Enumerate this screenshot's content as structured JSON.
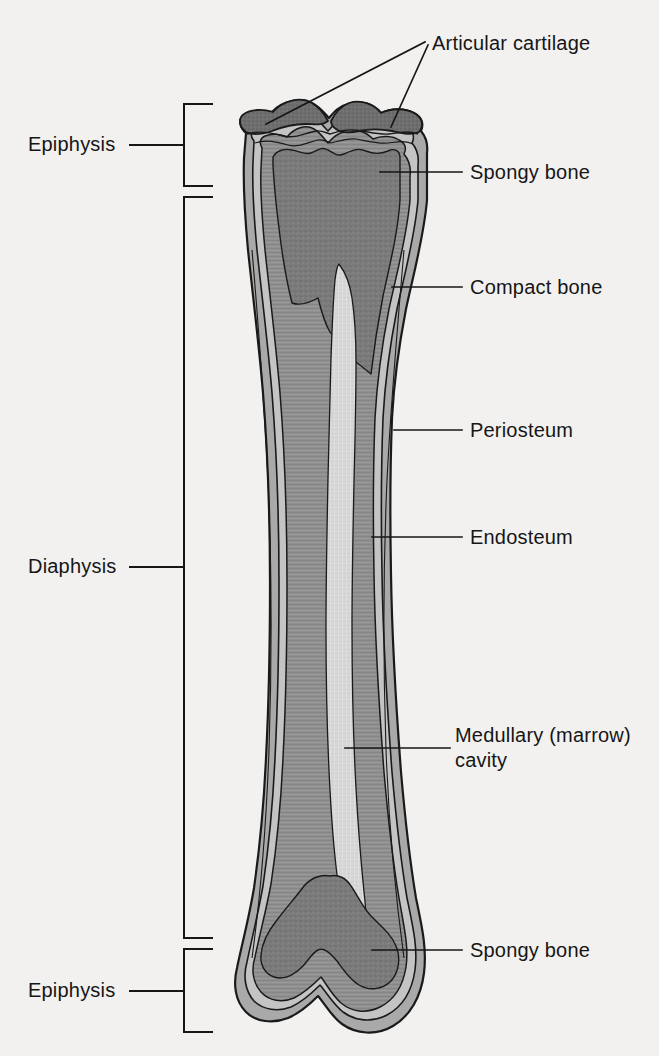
{
  "figure": {
    "background_color": "#f2f1ef",
    "ink_color": "#161616",
    "faint_top_text": "",
    "regions": {
      "spongy_bone_color": "#7b7b7b",
      "compact_bone_color": "#8f8f8f",
      "periosteum_color": "#a9a9a9",
      "endosteum_color": "#b9b9b9",
      "marrow_cavity_color": "#d7d7d7",
      "articular_cartilage_color": "#6e6e6e",
      "outline_color": "#1a1a1a"
    }
  },
  "labels": {
    "right": [
      {
        "id": "articular-cartilage",
        "text": "Articular cartilage",
        "x": 432,
        "y": 32,
        "lines": 1
      },
      {
        "id": "spongy-bone-top",
        "text": "Spongy bone",
        "x": 470,
        "y": 163,
        "lines": 1
      },
      {
        "id": "compact-bone",
        "text": "Compact bone",
        "x": 470,
        "y": 278,
        "lines": 1
      },
      {
        "id": "periosteum",
        "text": "Periosteum",
        "x": 470,
        "y": 421,
        "lines": 1
      },
      {
        "id": "endosteum",
        "text": "Endosteum",
        "x": 470,
        "y": 528,
        "lines": 1
      },
      {
        "id": "medullary-cavity",
        "text": "Medullary (marrow)\ncavity",
        "x": 455,
        "y": 724,
        "lines": 2
      },
      {
        "id": "spongy-bone-bottom",
        "text": "Spongy bone",
        "x": 470,
        "y": 941,
        "lines": 1
      }
    ],
    "left": [
      {
        "id": "epiphysis-top",
        "text": "Epiphysis",
        "x": 28,
        "y": 133
      },
      {
        "id": "diaphysis",
        "text": "Diaphysis",
        "x": 28,
        "y": 555
      },
      {
        "id": "epiphysis-bottom",
        "text": "Epiphysis",
        "x": 28,
        "y": 979
      }
    ]
  },
  "brackets": [
    {
      "id": "bracket-epiphysis-top",
      "top": 103,
      "bottom": 186,
      "spine_x": 184,
      "tick_x": 212,
      "tie_y": 145,
      "tie_x_start": 130
    },
    {
      "id": "bracket-diaphysis",
      "top": 196,
      "bottom": 938,
      "spine_x": 184,
      "tick_x": 212,
      "tie_y": 567,
      "tie_x_start": 130
    },
    {
      "id": "bracket-epiphysis-bottom",
      "top": 948,
      "bottom": 1032,
      "spine_x": 184,
      "tick_x": 212,
      "tie_y": 991,
      "tie_x_start": 130
    }
  ],
  "leaders": [
    {
      "id": "leader-articular-cartilage-left",
      "points": "425,42 266,124"
    },
    {
      "id": "leader-articular-cartilage-right",
      "points": "427,44 391,127"
    },
    {
      "id": "leader-spongy-bone-top",
      "points": "462,172 380,172"
    },
    {
      "id": "leader-compact-bone",
      "points": "462,287 392,287"
    },
    {
      "id": "leader-periosteum",
      "points": "462,430 394,430"
    },
    {
      "id": "leader-endosteum",
      "points": "462,537 372,537"
    },
    {
      "id": "leader-medullary-cavity",
      "points": "450,748 345,748"
    },
    {
      "id": "leader-spongy-bone-bottom",
      "points": "462,950 372,950"
    }
  ],
  "anatomy_parts": [
    {
      "name": "Articular cartilage",
      "description": "Hyaline cartilage capping the joint surfaces of the proximal epiphysis"
    },
    {
      "name": "Spongy bone",
      "description": "Trabecular bone filling the epiphyses at both ends"
    },
    {
      "name": "Compact bone",
      "description": "Dense cortical bone forming the wall of the diaphysis"
    },
    {
      "name": "Periosteum",
      "description": "Fibrous membrane covering the outer bone surface"
    },
    {
      "name": "Endosteum",
      "description": "Membrane lining the medullary cavity"
    },
    {
      "name": "Medullary (marrow) cavity",
      "description": "Central hollow of the diaphysis containing marrow"
    },
    {
      "name": "Epiphysis",
      "description": "Expanded end of the long bone, proximal and distal"
    },
    {
      "name": "Diaphysis",
      "description": "Elongated shaft between the two epiphyses"
    }
  ]
}
